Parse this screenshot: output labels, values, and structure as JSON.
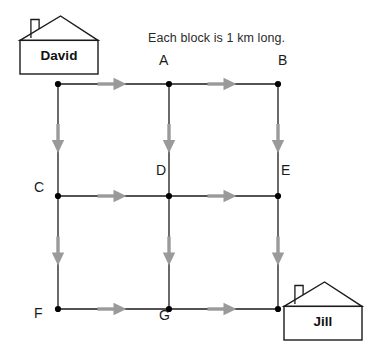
{
  "figure": {
    "width": 376,
    "height": 349,
    "background": "#ffffff",
    "caption": "Each block is 1 km long."
  },
  "colors": {
    "road_line": "#1a1a1a",
    "node_dot": "#000000",
    "arrow": "#9a9a9a",
    "house_outline": "#1a1a1a",
    "text": "#1a1a1a",
    "caption_text": "#2b2b2b"
  },
  "grid": {
    "columns_x": [
      58,
      169,
      278
    ],
    "rows_y": [
      84,
      196,
      309
    ],
    "block_length_km": 1,
    "nodes": [
      {
        "id": "n0",
        "label": "",
        "x": 58,
        "y": 84,
        "label_dx": 0,
        "label_dy": 0,
        "labeled": false
      },
      {
        "id": "A",
        "label": "A",
        "x": 169,
        "y": 84,
        "label_dx": -5,
        "label_dy": -24,
        "labeled": true
      },
      {
        "id": "B",
        "label": "B",
        "x": 278,
        "y": 84,
        "label_dx": 5,
        "label_dy": -24,
        "labeled": true
      },
      {
        "id": "C",
        "label": "C",
        "x": 58,
        "y": 196,
        "label_dx": -19,
        "label_dy": -9,
        "labeled": true
      },
      {
        "id": "D",
        "label": "D",
        "x": 169,
        "y": 196,
        "label_dx": -8,
        "label_dy": -26,
        "labeled": true
      },
      {
        "id": "E",
        "label": "E",
        "x": 278,
        "y": 196,
        "label_dx": 8,
        "label_dy": -26,
        "labeled": true
      },
      {
        "id": "F",
        "label": "F",
        "x": 58,
        "y": 309,
        "label_dx": -19,
        "label_dy": 4,
        "labeled": true
      },
      {
        "id": "G",
        "label": "G",
        "x": 169,
        "y": 309,
        "label_dx": -5,
        "label_dy": 6,
        "labeled": true
      },
      {
        "id": "n8",
        "label": "",
        "x": 278,
        "y": 309,
        "label_dx": 0,
        "label_dy": 0,
        "labeled": false
      }
    ],
    "edges": [
      {
        "id": "e-top-left",
        "from": "n0",
        "to": "A",
        "direction": "right"
      },
      {
        "id": "e-top-right",
        "from": "A",
        "to": "B",
        "direction": "right"
      },
      {
        "id": "e-mid-left",
        "from": "C",
        "to": "D",
        "direction": "right"
      },
      {
        "id": "e-mid-right",
        "from": "D",
        "to": "E",
        "direction": "right"
      },
      {
        "id": "e-bottom-left",
        "from": "F",
        "to": "G",
        "direction": "right"
      },
      {
        "id": "e-bottom-right",
        "from": "G",
        "to": "n8",
        "direction": "right"
      },
      {
        "id": "e-col1-upper",
        "from": "n0",
        "to": "C",
        "direction": "down"
      },
      {
        "id": "e-col1-lower",
        "from": "C",
        "to": "F",
        "direction": "down"
      },
      {
        "id": "e-col2-upper",
        "from": "A",
        "to": "D",
        "direction": "down"
      },
      {
        "id": "e-col2-lower",
        "from": "D",
        "to": "G",
        "direction": "down"
      },
      {
        "id": "e-col3-upper",
        "from": "B",
        "to": "E",
        "direction": "down"
      },
      {
        "id": "e-col3-lower",
        "from": "E",
        "to": "n8",
        "direction": "down"
      }
    ]
  },
  "houses": [
    {
      "id": "david",
      "name": "David",
      "label": "David",
      "at_node": "n0",
      "box": {
        "x": 20,
        "y": 16,
        "width": 78,
        "height": 58
      }
    },
    {
      "id": "jill",
      "name": "Jill",
      "label": "Jill",
      "at_node": "n8",
      "box": {
        "x": 284,
        "y": 282,
        "width": 78,
        "height": 58
      }
    }
  ]
}
